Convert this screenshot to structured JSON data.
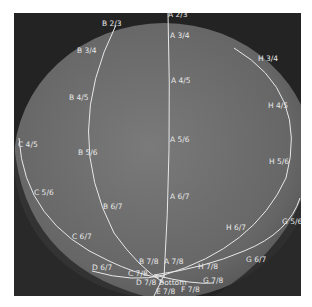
{
  "image": {
    "description": "Dark grayscale rendering of a sphere with white great-circle-like curves and text labels",
    "background_color": "#232323",
    "sphere_color": "#6f6f6f",
    "line_color": "#e8e8e8"
  },
  "labels": {
    "A": [
      "A 2/3",
      "A 3/4",
      "A 4/5",
      "A 5/6",
      "A 6/7",
      "A 7/8"
    ],
    "B": [
      "B 2/3",
      "B 3/4",
      "B 4/5",
      "B 5/6",
      "B 6/7",
      "B 7/8"
    ],
    "C": [
      "C 4/5",
      "C 5/6",
      "C 6/7",
      "C 7/8"
    ],
    "D": [
      "D 6/7",
      "D 7/8"
    ],
    "E": [
      "E 7/8"
    ],
    "F": [
      "F 7/8"
    ],
    "G": [
      "G 5/6",
      "G 6/7",
      "G 7/8"
    ],
    "H": [
      "H 3/4",
      "H 4/5",
      "H 5/6",
      "H 6/7",
      "H 7/8"
    ],
    "center": "Bottom"
  }
}
